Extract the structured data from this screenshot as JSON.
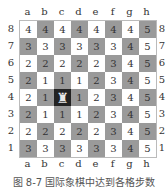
{
  "files": [
    "a",
    "b",
    "c",
    "d",
    "e",
    "f",
    "g",
    "h"
  ],
  "ranks": [
    "8",
    "7",
    "6",
    "5",
    "4",
    "3",
    "2",
    "1"
  ],
  "board": [
    [
      "4",
      "4",
      "4",
      "4",
      "4",
      "4",
      "4",
      "5"
    ],
    [
      "3",
      "3",
      "3",
      "3",
      "3",
      "3",
      "4",
      "5"
    ],
    [
      "2",
      "2",
      "2",
      "2",
      "2",
      "3",
      "4",
      "5"
    ],
    [
      "2",
      "1",
      "1",
      "1",
      "2",
      "3",
      "4",
      "5"
    ],
    [
      "2",
      "1",
      "♜",
      "1",
      "2",
      "3",
      "4",
      "5"
    ],
    [
      "2",
      "1",
      "1",
      "1",
      "2",
      "3",
      "4",
      "5"
    ],
    [
      "2",
      "2",
      "2",
      "2",
      "2",
      "3",
      "4",
      "5"
    ],
    [
      "3",
      "3",
      "3",
      "3",
      "3",
      "3",
      "4",
      "5"
    ]
  ],
  "piece": {
    "name": "rook",
    "square": "c4",
    "glyph": "♜"
  },
  "colors": {
    "light": "#ffffff",
    "dark": "#9a9a9a",
    "piece_square": "#222222"
  },
  "caption": "图 8-7  国际象棋中达到各格步数"
}
